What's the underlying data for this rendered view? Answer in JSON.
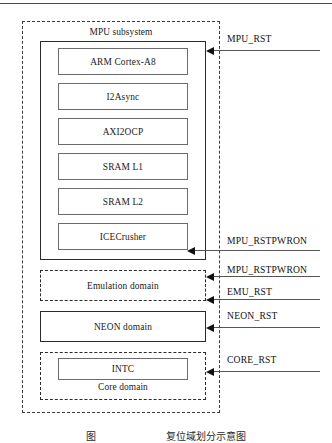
{
  "figure": {
    "type": "block-diagram",
    "top_rule": true,
    "caption": "图　　　　　　　复位域划分示意图"
  },
  "outer_domain": {
    "label": "",
    "style": "dashed"
  },
  "mpu_subsystem": {
    "title": "MPU subsystem",
    "modules": [
      {
        "label": "ARM  Cortex-A8"
      },
      {
        "label": "I2Async"
      },
      {
        "label": "AXI2OCP"
      },
      {
        "label": "SRAM L1"
      },
      {
        "label": "SRAM  L2"
      },
      {
        "label": "ICECrusher"
      }
    ]
  },
  "domains": [
    {
      "id": "emulation",
      "label": "Emulation domain",
      "style": "dashed"
    },
    {
      "id": "neon",
      "label": "NEON domain",
      "style": "solid"
    },
    {
      "id": "core",
      "label": "Core domain",
      "style": "dashed",
      "child": {
        "label": "INTC",
        "style": "solid"
      }
    }
  ],
  "signals": [
    {
      "id": "mpu_rst",
      "label": "MPU_RST"
    },
    {
      "id": "mpu_rstpwron_ice",
      "label": "MPU_RSTPWRON"
    },
    {
      "id": "mpu_rstpwron_emu",
      "label": "MPU_RSTPWRON"
    },
    {
      "id": "emu_rst",
      "label": "EMU_RST"
    },
    {
      "id": "neon_rst",
      "label": "NEON_RST"
    },
    {
      "id": "core_rst",
      "label": "CORE_RST"
    }
  ],
  "colors": {
    "stroke": "#2b2b2b",
    "thin_stroke": "#6b6b6b",
    "signal": "#555555",
    "text": "#1a1a1a",
    "background": "#ffffff"
  }
}
